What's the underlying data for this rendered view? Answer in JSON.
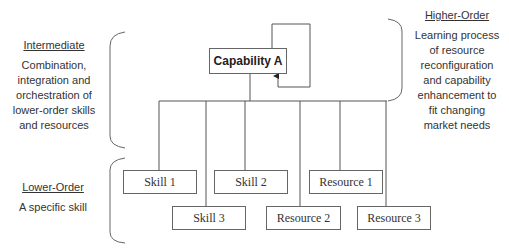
{
  "diagram": {
    "top_node": {
      "label": "Capability A"
    },
    "levels": {
      "higher": {
        "title": "Higher-Order",
        "description": "Learning process of resource reconfiguration and capability enhancement to fit changing market needs",
        "lines": [
          "Learning process",
          "of resource",
          "reconfiguration",
          "and capability",
          "enhancement to",
          "fit changing",
          "market needs"
        ]
      },
      "intermediate": {
        "title": "Intermediate",
        "description": "Combination, integration and orchestration of lower-order skills and resources",
        "lines": [
          "Combination,",
          "integration and",
          "orchestration of",
          "lower-order skills",
          "and resources"
        ]
      },
      "lower": {
        "title": "Lower-Order",
        "description": "A specific skill"
      }
    },
    "children": [
      {
        "label": "Skill 1"
      },
      {
        "label": "Skill 2"
      },
      {
        "label": "Resource 1"
      },
      {
        "label": "Skill 3"
      },
      {
        "label": "Resource 2"
      },
      {
        "label": "Resource 3"
      }
    ],
    "colors": {
      "line": "#555555",
      "box_border": "#666666",
      "text": "#333333"
    }
  }
}
